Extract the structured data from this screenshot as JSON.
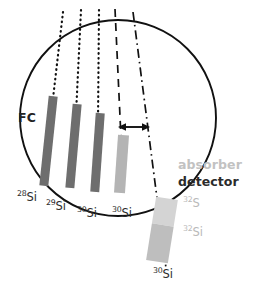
{
  "figure": {
    "type": "schematic-diagram",
    "title_fragment_cropped": "",
    "background_color": "#ffffff",
    "width": 253,
    "height": 294
  },
  "chamber": {
    "name": "faraday-cup-chamber",
    "shape": "circle",
    "center_x": 118,
    "center_y": 118,
    "radius": 98,
    "stroke_color": "#111111",
    "stroke_width": 1.8,
    "label": "FC",
    "label_x": 18,
    "label_y": 118
  },
  "beam_lines": [
    {
      "id": "beam-28si",
      "style": "dotted",
      "x_top": 63,
      "y_top": 12,
      "x_bottom": 52,
      "y_bottom": 107,
      "color": "#111111"
    },
    {
      "id": "beam-29si",
      "style": "dotted",
      "x_top": 81,
      "y_top": 10,
      "x_bottom": 76,
      "y_bottom": 114,
      "color": "#111111"
    },
    {
      "id": "beam-30si-a",
      "style": "dotted",
      "x_top": 99,
      "y_top": 10,
      "x_bottom": 98,
      "y_bottom": 122,
      "color": "#111111"
    },
    {
      "id": "beam-30si-b",
      "style": "dashed",
      "x_top": 115,
      "y_top": 9,
      "x_bottom": 121,
      "y_bottom": 136,
      "color": "#111111"
    },
    {
      "id": "beam-30si-detector",
      "style": "dash-dot",
      "x_top": 133,
      "y_top": 12,
      "x_bottom": 165,
      "y_bottom": 266,
      "color": "#111111"
    }
  ],
  "bars": [
    {
      "id": "bar-28si",
      "fill": "#6e6e6e",
      "x": 44,
      "y": 96,
      "width": 9,
      "height": 90,
      "rotation_deg": 6,
      "label": "28Si",
      "mass": "28",
      "element": "Si"
    },
    {
      "id": "bar-29si",
      "fill": "#6e6e6e",
      "x": 69,
      "y": 104,
      "width": 9,
      "height": 84,
      "rotation_deg": 5,
      "label": "29Si",
      "mass": "29",
      "element": "Si"
    },
    {
      "id": "bar-30si-a",
      "fill": "#6e6e6e",
      "x": 93,
      "y": 113,
      "width": 9,
      "height": 79,
      "rotation_deg": 4,
      "label": "30Si",
      "mass": "30",
      "element": "Si"
    },
    {
      "id": "bar-30si-b",
      "fill": "#b4b4b4",
      "x": 116,
      "y": 135,
      "width": 11,
      "height": 58,
      "rotation_deg": 4,
      "label": "30Si",
      "mass": "30",
      "element": "Si"
    }
  ],
  "bar_labels": [
    {
      "id": "label-28si",
      "mass": "28",
      "element": "Si",
      "x": 17,
      "y": 196,
      "tone": "dark"
    },
    {
      "id": "label-29si",
      "mass": "29",
      "element": "Si",
      "x": 46,
      "y": 205,
      "tone": "dark"
    },
    {
      "id": "label-30si-a",
      "mass": "30",
      "element": "Si",
      "x": 78,
      "y": 211,
      "tone": "dark"
    },
    {
      "id": "label-30si-b",
      "mass": "30",
      "element": "Si",
      "x": 112,
      "y": 211,
      "tone": "dark"
    }
  ],
  "arrow": {
    "id": "separation-arrow",
    "style": "double-headed",
    "x_start": 120,
    "x_end": 148,
    "y": 127,
    "color": "#111111",
    "meaning": "separation between dashed and dash-dot trajectories"
  },
  "detector_stack": {
    "name": "absorber-detector-stack",
    "x": 151,
    "y": 198,
    "width": 22,
    "height": 64,
    "rotation_deg": 9,
    "segments": [
      {
        "id": "absorber-segment",
        "label": "absorber",
        "fill": "#d2d2d2",
        "fraction": 0.42
      },
      {
        "id": "detector-segment",
        "label": "detector",
        "fill": "#bcbcbc",
        "fraction": 0.58
      }
    ],
    "legend": {
      "absorber_label": "absorber",
      "absorber_label_x": 178,
      "absorber_label_y": 165,
      "absorber_color": "#c2c2c2",
      "detector_label": "detector",
      "detector_label_x": 178,
      "detector_label_y": 182,
      "detector_color": "#2b2b2b"
    }
  },
  "detector_labels": [
    {
      "id": "label-32s",
      "mass": "32",
      "element": "S",
      "x": 182,
      "y": 201,
      "tone": "faint"
    },
    {
      "id": "label-32si",
      "mass": "32",
      "element": "Si",
      "x": 182,
      "y": 230,
      "tone": "faint"
    },
    {
      "id": "label-30si-bottom",
      "mass": "30",
      "element": "Si",
      "x": 153,
      "y": 272,
      "tone": "dark"
    }
  ]
}
